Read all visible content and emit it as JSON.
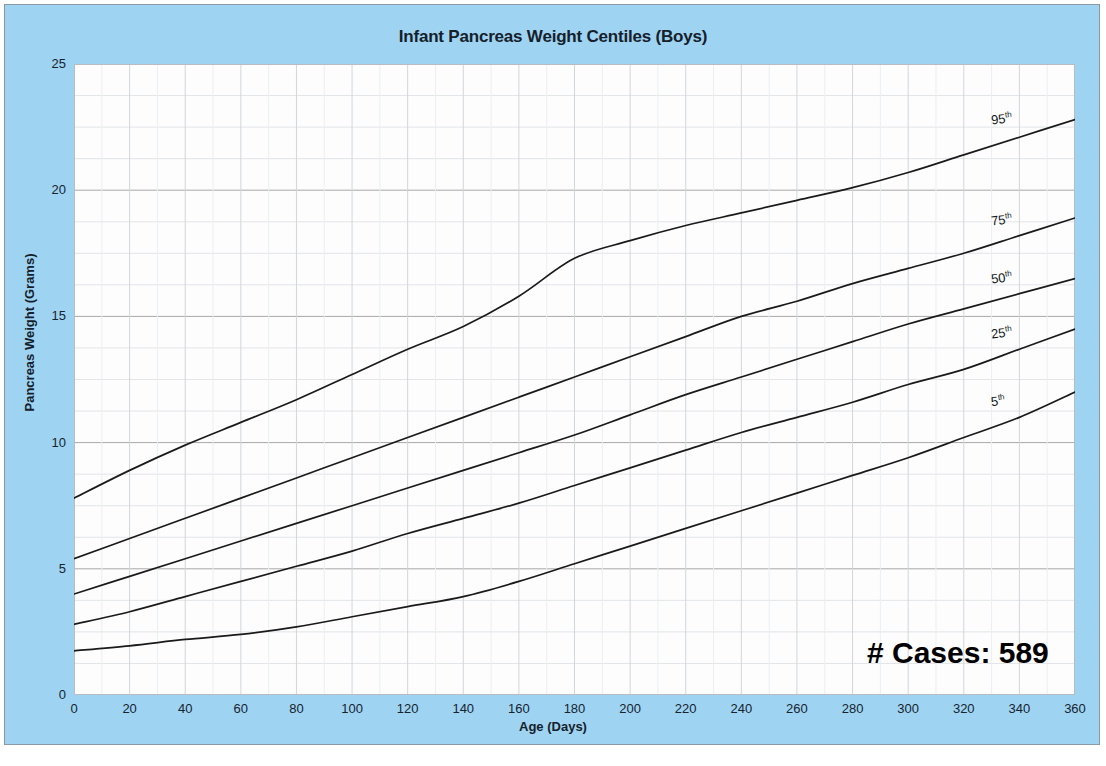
{
  "chart_data": {
    "type": "line",
    "title": "Infant Pancreas Weight Centiles (Boys)",
    "xlabel": "Age (Days)",
    "ylabel": "Pancreas Weight (Grams)",
    "xlim": [
      0,
      360
    ],
    "ylim": [
      0,
      25
    ],
    "xticks": [
      0,
      20,
      40,
      60,
      80,
      100,
      120,
      140,
      160,
      180,
      200,
      220,
      240,
      260,
      280,
      300,
      320,
      340,
      360
    ],
    "yticks": [
      0,
      5,
      10,
      15,
      20,
      25
    ],
    "grid": true,
    "legend_position": "inline-right-end",
    "annotation": "# Cases: 589",
    "x": [
      0,
      20,
      40,
      60,
      80,
      100,
      120,
      140,
      160,
      180,
      200,
      220,
      240,
      260,
      280,
      300,
      320,
      340,
      360
    ],
    "series": [
      {
        "name": "95th",
        "label": "95",
        "suffix": "th",
        "values": [
          7.8,
          8.9,
          9.9,
          10.8,
          11.7,
          12.7,
          13.7,
          14.6,
          15.8,
          17.3,
          18.0,
          18.6,
          19.1,
          19.6,
          20.1,
          20.7,
          21.4,
          22.1,
          22.8
        ]
      },
      {
        "name": "75th",
        "label": "75",
        "suffix": "th",
        "values": [
          5.4,
          6.2,
          7.0,
          7.8,
          8.6,
          9.4,
          10.2,
          11.0,
          11.8,
          12.6,
          13.4,
          14.2,
          15.0,
          15.6,
          16.3,
          16.9,
          17.5,
          18.2,
          18.9
        ]
      },
      {
        "name": "50th",
        "label": "50",
        "suffix": "th",
        "values": [
          4.0,
          4.7,
          5.4,
          6.1,
          6.8,
          7.5,
          8.2,
          8.9,
          9.6,
          10.3,
          11.1,
          11.9,
          12.6,
          13.3,
          14.0,
          14.7,
          15.3,
          15.9,
          16.5
        ]
      },
      {
        "name": "25th",
        "label": "25",
        "suffix": "th",
        "values": [
          2.8,
          3.3,
          3.9,
          4.5,
          5.1,
          5.7,
          6.4,
          7.0,
          7.6,
          8.3,
          9.0,
          9.7,
          10.4,
          11.0,
          11.6,
          12.3,
          12.9,
          13.7,
          14.5
        ]
      },
      {
        "name": "5th",
        "label": "5",
        "suffix": "th",
        "values": [
          1.75,
          1.95,
          2.2,
          2.4,
          2.7,
          3.1,
          3.5,
          3.9,
          4.5,
          5.2,
          5.9,
          6.6,
          7.3,
          8.0,
          8.7,
          9.4,
          10.2,
          11.0,
          12.0
        ]
      }
    ]
  }
}
